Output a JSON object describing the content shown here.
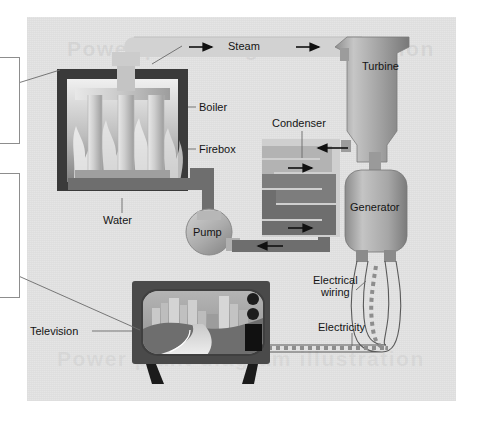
{
  "diagram": {
    "title_watermark": "Power plant diagram illustration",
    "background_color": "#e3e3e3",
    "page_color": "#ffffff",
    "labels": [
      {
        "id": "steam",
        "text": "Steam",
        "x": 228,
        "y": 45
      },
      {
        "id": "turbine",
        "text": "Turbine",
        "x": 362,
        "y": 66
      },
      {
        "id": "boiler",
        "text": "Boiler",
        "x": 197,
        "y": 110
      },
      {
        "id": "condenser",
        "text": "Condenser",
        "x": 272,
        "y": 121
      },
      {
        "id": "firebox",
        "text": "Firebox",
        "x": 197,
        "y": 152
      },
      {
        "id": "generator",
        "text": "Generator",
        "x": 355,
        "y": 206
      },
      {
        "id": "water",
        "text": "Water",
        "x": 108,
        "y": 218
      },
      {
        "id": "pump",
        "text": "Pump",
        "x": 205,
        "y": 231
      },
      {
        "id": "electrical-wiring",
        "text": "Electrical\nwiring",
        "x": 319,
        "y": 279
      },
      {
        "id": "television",
        "text": "Television",
        "x": 34,
        "y": 327
      },
      {
        "id": "electricity",
        "text": "Electricity",
        "x": 320,
        "y": 327
      }
    ],
    "callouts": [
      {
        "id": "callout-top",
        "x": -40,
        "y": 57,
        "w": 58,
        "h": 85,
        "text": ""
      },
      {
        "id": "callout-bottom",
        "x": -40,
        "y": 173,
        "w": 58,
        "h": 123,
        "text": ""
      }
    ],
    "flow_arrows": [
      {
        "id": "steam-arrow-1",
        "direction": "right"
      },
      {
        "id": "steam-arrow-2",
        "direction": "right"
      },
      {
        "id": "turbine-in-arrow",
        "direction": "left"
      },
      {
        "id": "condenser-arrow-1",
        "direction": "right"
      },
      {
        "id": "condenser-arrow-2",
        "direction": "right"
      },
      {
        "id": "pump-return-arrow",
        "direction": "left"
      }
    ],
    "colors": {
      "panel_bg": "#e3e3e3",
      "firebox_dark": "#3a3a3a",
      "pipe_dark": "#6e6e6e",
      "pipe_mid": "#8f8f8f",
      "pipe_light": "#b8b8b8",
      "steam_band": "#d2d2d2",
      "tv_frame": "#4a4a4a",
      "tv_sky": "#a9a9a9",
      "tv_ground": "#6b6b6b",
      "metal_light": "#c9c9c9",
      "metal_dark": "#7c7c7c",
      "label_text": "#141414",
      "leader_line": "#6a6a6a"
    },
    "components": [
      "boiler",
      "firebox",
      "water-tubes",
      "steam-pipe",
      "turbine",
      "generator",
      "condenser-coil",
      "pump",
      "television",
      "electrical-wiring",
      "electricity-dashes"
    ]
  }
}
